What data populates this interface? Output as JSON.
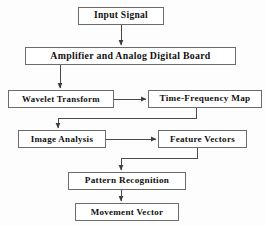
{
  "diagram": {
    "type": "flowchart",
    "orientation": "top-to-bottom",
    "canvas": {
      "width": 266,
      "height": 226
    },
    "style": {
      "background_color": "#fdfdfd",
      "box_fill": "#ffffff",
      "box_border_color": "#6b6b6b",
      "connector_color": "#4a4a4a",
      "text_color": "#111111"
    },
    "nodes": [
      {
        "id": "input-signal",
        "label": "Input Signal",
        "x": 78,
        "y": 7,
        "width": 86,
        "height": 18,
        "font_size": 9.5
      },
      {
        "id": "amplifier-adc",
        "label": "Amplifier and Analog Digital Board",
        "x": 25,
        "y": 47,
        "width": 211,
        "height": 18,
        "font_size": 9.8
      },
      {
        "id": "wavelet-transform",
        "label": "Wavelet Transform",
        "x": 8,
        "y": 90,
        "width": 106,
        "height": 18,
        "font_size": 8.8
      },
      {
        "id": "time-frequency-map",
        "label": "Time-Frequency Map",
        "x": 148,
        "y": 90,
        "width": 114,
        "height": 18,
        "font_size": 9.2
      },
      {
        "id": "image-analysis",
        "label": "Image Analysis",
        "x": 18,
        "y": 130,
        "width": 88,
        "height": 18,
        "font_size": 9.0
      },
      {
        "id": "feature-vectors",
        "label": "Feature Vectors",
        "x": 158,
        "y": 130,
        "width": 89,
        "height": 18,
        "font_size": 9.0
      },
      {
        "id": "pattern-recognition",
        "label": "Pattern Recognition",
        "x": 68,
        "y": 172,
        "width": 118,
        "height": 18,
        "font_size": 9.2
      },
      {
        "id": "movement-vector",
        "label": "Movement Vector",
        "x": 75,
        "y": 203,
        "width": 104,
        "height": 18,
        "font_size": 9.0
      }
    ],
    "edges": [
      {
        "id": "e1",
        "from": "input-signal",
        "to": "amplifier-adc",
        "kind": "straight-down",
        "points": "121,25 121,45",
        "arrow": true
      },
      {
        "id": "e2",
        "from": "amplifier-adc",
        "to": "wavelet-transform",
        "kind": "straight-down",
        "points": "60,65 60,88",
        "arrow": true
      },
      {
        "id": "e3",
        "from": "wavelet-transform",
        "to": "time-frequency-map",
        "kind": "straight-right",
        "points": "114,99 146,99",
        "arrow": true
      },
      {
        "id": "e4",
        "from": "time-frequency-map",
        "to": "image-analysis",
        "kind": "elbow-down-left-down",
        "points": "196,108 196,118 58,118 58,128",
        "arrow": true
      },
      {
        "id": "e5",
        "from": "image-analysis",
        "to": "feature-vectors",
        "kind": "straight-right",
        "points": "106,139 156,139",
        "arrow": true
      },
      {
        "id": "e6",
        "from": "feature-vectors",
        "to": "pattern-recognition",
        "kind": "elbow-down-left-down",
        "points": "197,148 197,158 121,158 121,170",
        "arrow": true
      },
      {
        "id": "e7",
        "from": "pattern-recognition",
        "to": "movement-vector",
        "kind": "straight-down",
        "points": "121,190 121,201",
        "arrow": true
      }
    ]
  }
}
